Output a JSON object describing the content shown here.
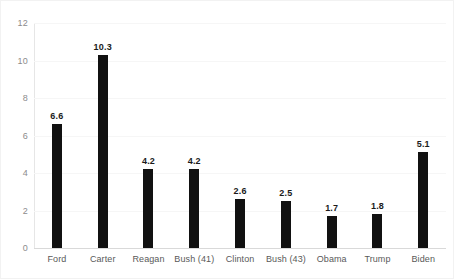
{
  "chart_data": {
    "type": "bar",
    "title": "",
    "subtitle": "",
    "xlabel": "",
    "ylabel": "",
    "categories": [
      "Ford",
      "Carter",
      "Reagan",
      "Bush (41)",
      "Clinton",
      "Bush (43)",
      "Obama",
      "Trump",
      "Biden"
    ],
    "values": [
      6.6,
      10.3,
      4.2,
      4.2,
      2.6,
      2.5,
      1.7,
      1.8,
      5.1
    ],
    "data_labels": [
      "6.6",
      "10.3",
      "4.2",
      "4.2",
      "2.6",
      "2.5",
      "1.7",
      "1.8",
      "5.1"
    ],
    "ylim": [
      0,
      12
    ],
    "y_ticks": [
      0,
      2,
      4,
      6,
      8,
      10,
      12
    ],
    "y_tick_labels": [
      "0",
      "2",
      "4",
      "6",
      "8",
      "10",
      "12"
    ],
    "grid": true,
    "grid_axis": "y",
    "legend": false,
    "legend_position": "none",
    "bar_color": "#111111",
    "gridline_color": "#f6f6f6",
    "axis_color": "#d9d9d9",
    "tick_label_color": "#8c8c8c",
    "category_label_color": "#595959",
    "data_label_color": "#1a1a1a",
    "background_color": "#ffffff",
    "border_color": "#f2f2f2"
  }
}
